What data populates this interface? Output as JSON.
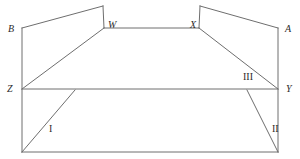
{
  "figure": {
    "background_color": "#ffffff",
    "stroke_color": "#6e6e6e",
    "label_color": "#2b2b2b",
    "width": 300,
    "height": 159,
    "vertex_labels": [
      {
        "id": "B",
        "text": "B",
        "x": 8,
        "y": 24
      },
      {
        "id": "W",
        "text": "W",
        "x": 108,
        "y": 20
      },
      {
        "id": "X",
        "text": "X",
        "x": 190,
        "y": 20
      },
      {
        "id": "A",
        "text": "A",
        "x": 285,
        "y": 24
      },
      {
        "id": "Z",
        "text": "Z",
        "x": 7,
        "y": 84
      },
      {
        "id": "Y",
        "text": "Y",
        "x": 286,
        "y": 84
      }
    ],
    "region_labels": [
      {
        "id": "I",
        "text": "I",
        "x": 49,
        "y": 124
      },
      {
        "id": "II",
        "text": "II",
        "x": 272,
        "y": 124
      },
      {
        "id": "III",
        "text": "III",
        "x": 243,
        "y": 72
      }
    ],
    "segments": [
      {
        "name": "left-vertical-edge",
        "x1": 22,
        "y1": 28,
        "x2": 22,
        "y2": 152
      },
      {
        "name": "right-vertical-edge",
        "x1": 278,
        "y1": 28,
        "x2": 278,
        "y2": 152
      },
      {
        "name": "bottom-edge",
        "x1": 22,
        "y1": 152,
        "x2": 278,
        "y2": 152
      },
      {
        "name": "edge-B-to-top-left-peak",
        "x1": 22,
        "y1": 28,
        "x2": 103,
        "y2": 6
      },
      {
        "name": "edge-top-left-peak-to-W",
        "x1": 103,
        "y1": 6,
        "x2": 104,
        "y2": 28
      },
      {
        "name": "edge-W-to-X",
        "x1": 104,
        "y1": 28,
        "x2": 199,
        "y2": 28
      },
      {
        "name": "edge-X-to-top-right-peak",
        "x1": 199,
        "y1": 28,
        "x2": 200,
        "y2": 6
      },
      {
        "name": "edge-top-right-peak-to-A",
        "x1": 200,
        "y1": 6,
        "x2": 278,
        "y2": 28
      },
      {
        "name": "edge-Z-to-W-diagonal",
        "x1": 22,
        "y1": 89,
        "x2": 104,
        "y2": 28
      },
      {
        "name": "edge-X-to-Y-diagonal",
        "x1": 199,
        "y1": 28,
        "x2": 278,
        "y2": 89
      },
      {
        "name": "edge-Z-to-Y-horizontal",
        "x1": 22,
        "y1": 89,
        "x2": 278,
        "y2": 89
      },
      {
        "name": "edge-region-I-diagonal",
        "x1": 75,
        "y1": 90,
        "x2": 22,
        "y2": 152
      },
      {
        "name": "edge-region-II-diagonal",
        "x1": 247,
        "y1": 90,
        "x2": 278,
        "y2": 152
      }
    ]
  }
}
